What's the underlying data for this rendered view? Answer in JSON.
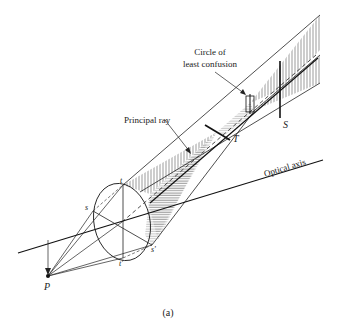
{
  "figure": {
    "caption": "(a)",
    "labels": {
      "circle_line1": "Circle of",
      "circle_line2": "least confusion",
      "principal_ray": "Principal ray",
      "optical_axis": "Optical axis",
      "point_P": "P",
      "point_T": "T",
      "point_S": "S",
      "t_top": "t",
      "t_bottom": "t'",
      "s_left": "s",
      "s_right": "s'"
    },
    "colors": {
      "ink": "#222222",
      "hatch": "#555555"
    }
  }
}
